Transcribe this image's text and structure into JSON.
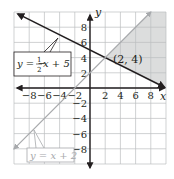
{
  "chart_data": {
    "type": "line",
    "title": "",
    "xlabel": "x",
    "ylabel": "y",
    "xlim": [
      -10,
      10
    ],
    "ylim": [
      -10,
      10
    ],
    "grid": true,
    "grid_step": 2,
    "x_ticks": [
      -8,
      -6,
      -4,
      -2,
      2,
      4,
      6,
      8
    ],
    "y_ticks": [
      -8,
      -6,
      -4,
      -2,
      2,
      4,
      6,
      8
    ],
    "x_tick_labels": [
      "−8",
      "−6",
      "−4",
      "−2",
      "2",
      "4",
      "6",
      "8"
    ],
    "y_tick_labels": [
      "−8",
      "−6",
      "−4",
      "−2",
      "2",
      "4",
      "6",
      "8"
    ],
    "series": [
      {
        "name": "y = -1/2x + 5",
        "label_display": "y = −½x + 5",
        "slope": -0.5,
        "intercept": 5,
        "x_range": [
          -9.5,
          9.8
        ],
        "color": "#231f20",
        "arrows": "both"
      },
      {
        "name": "y = x + 2",
        "label_display": "y = x + 2",
        "slope": 1,
        "intercept": 2,
        "x_range": [
          -10,
          8
        ],
        "color": "#a7a9ac",
        "arrows": "both"
      }
    ],
    "shaded_region": {
      "description": "y > -1/2x + 5 and y < x + 2",
      "color": "#dcdddd"
    },
    "annotations": [
      {
        "text": "(2, 4)",
        "x": 2,
        "y": 4
      }
    ]
  },
  "labels": {
    "x_axis": "x",
    "y_axis": "y",
    "point": "(2, 4)",
    "line1_prefix": "y = −",
    "line1_num": "1",
    "line1_den": "2",
    "line1_suffix": "x + 5",
    "line2": "y = x + 2"
  }
}
